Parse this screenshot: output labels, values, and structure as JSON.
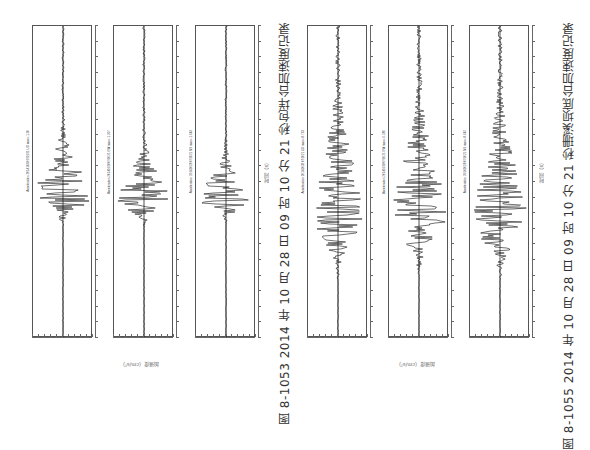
{
  "page": {
    "orientation": "rotated 90deg counter-clockwise",
    "figures": [
      {
        "id": "fig-8-1053",
        "caption": "图 8-1053   2014 年 10 月 28 日 09 时 10 分 21 秒包垟台加速度记录",
        "x_axis_label": "加速度（cm/s²）",
        "time_axis_label": "时间（s）",
        "panels": [
          {
            "component": "UD",
            "title": "Acceleration 20141028 091021 UD max=-1.50",
            "left": 32
          },
          {
            "component": "EW",
            "title": "Acceleration 20141028 091021 EW max=-1.207",
            "left": 113
          },
          {
            "component": "NS",
            "title": "Acceleration 20141028 091021 NS max=-1.643",
            "left": 195
          }
        ]
      },
      {
        "id": "fig-8-1055",
        "caption": "图 8-1055   2014 年 10 月 28 日 09 时 10 分 21 秒珊溪坝底台加速度记录",
        "x_axis_label": "加速度（cm/s²）",
        "time_axis_label": "时间（s）",
        "panels": [
          {
            "component": "UD",
            "title": "Acceleration 20141028 091021 UD max=-8.763",
            "left": 307
          },
          {
            "component": "EW",
            "title": "Acceleration 20141028 091021 EW max=-6.286",
            "left": 388
          },
          {
            "component": "NS",
            "title": "Acceleration 20141028 091021 NS max=-8.642",
            "left": 469
          }
        ]
      }
    ]
  },
  "chart_data": [
    {
      "type": "line",
      "title": "图 8-1053 2014年10月28日09时10分21秒包垟台加速度记录",
      "series": [
        {
          "name": "UD",
          "peak_abs": 1.5,
          "peak_time_fraction": 0.55
        },
        {
          "name": "EW",
          "peak_abs": 1.2,
          "peak_time_fraction": 0.55
        },
        {
          "name": "NS",
          "peak_abs": 1.6,
          "peak_time_fraction": 0.55
        }
      ],
      "xlabel": "时间（s）",
      "ylabel": "加速度（cm/s²）",
      "time_ticks": [
        "0",
        "2",
        "4",
        "6",
        "8",
        "10",
        "12",
        "14",
        "16",
        "18",
        "20",
        "22",
        "24",
        "26",
        "28",
        "30",
        "32",
        "34",
        "36",
        "38",
        "40"
      ],
      "amplitude_ticks_fig1": [
        "-2.0",
        "-1.6",
        "-1.2",
        "-0.8",
        "-0.4",
        "0",
        "0.4",
        "0.8",
        "1.2",
        "1.6",
        "2.0"
      ],
      "grid": false,
      "note": "Rotated seismogram plots; time runs vertically, amplitude horizontally"
    },
    {
      "type": "line",
      "title": "图 8-1055 2014年10月28日09时10分21秒珊溪坝底台加速度记录",
      "series": [
        {
          "name": "UD",
          "peak_abs": 8.8,
          "peak_time_fraction": 0.6
        },
        {
          "name": "EW",
          "peak_abs": 6.3,
          "peak_time_fraction": 0.6
        },
        {
          "name": "NS",
          "peak_abs": 8.6,
          "peak_time_fraction": 0.6
        }
      ],
      "xlabel": "时间（s）",
      "ylabel": "加速度（cm/s²）",
      "time_ticks": [
        "0",
        "2",
        "4",
        "6",
        "8",
        "10",
        "12",
        "14",
        "16",
        "18",
        "20",
        "22",
        "24",
        "26",
        "28",
        "30",
        "32",
        "34",
        "36",
        "38",
        "40"
      ],
      "amplitude_ticks_fig2": [
        "-10",
        "-8",
        "-6",
        "-4",
        "-2",
        "0",
        "2",
        "4",
        "6",
        "8",
        "10"
      ],
      "grid": false
    }
  ]
}
